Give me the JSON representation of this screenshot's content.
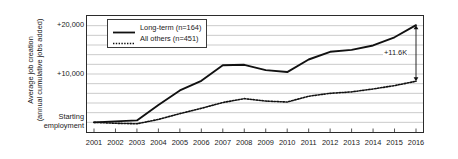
{
  "chart_data": {
    "type": "line",
    "title": "",
    "xlabel": "",
    "ylabel_line1": "Average job creation",
    "ylabel_line2": "(annual cumulative jobs added)",
    "x": [
      2001,
      2002,
      2003,
      2004,
      2005,
      2006,
      2007,
      2008,
      2009,
      2010,
      2011,
      2012,
      2013,
      2014,
      2015,
      2016
    ],
    "categories": [
      "2001",
      "2002",
      "2003",
      "2004",
      "2005",
      "2006",
      "2007",
      "2008",
      "2009",
      "2010",
      "2011",
      "2012",
      "2013",
      "2014",
      "2015",
      "2016"
    ],
    "series": [
      {
        "name": "Long-term (n=164)",
        "style": "solid",
        "color": "#111111",
        "values": [
          0,
          200,
          400,
          3600,
          6600,
          8600,
          11800,
          11900,
          10800,
          10400,
          13000,
          14600,
          15000,
          15900,
          17600,
          20100
        ]
      },
      {
        "name": "All others (n=451)",
        "style": "dotted",
        "color": "#111111",
        "values": [
          0,
          -200,
          -300,
          600,
          1800,
          2900,
          4100,
          4900,
          4400,
          4200,
          5400,
          6000,
          6300,
          6900,
          7600,
          8500
        ]
      }
    ],
    "ylim": [
      -2000,
      22000
    ],
    "yticks_major": [
      {
        "value": 20000,
        "label": "+20,000"
      },
      {
        "value": 10000,
        "label": "+10,000"
      },
      {
        "value": 0,
        "label": "Starting\nemployment"
      }
    ],
    "ytick_label_20000": "+20,000",
    "ytick_label_10000": "+10,000",
    "ytick_label_0_line1": "Starting",
    "ytick_label_0_line2": "employment",
    "gridline_step": 2000,
    "grid": true,
    "grid_color": "#b4b4b4",
    "legend_position": "top-left-inside",
    "annotations": [
      {
        "text": "+11.6K",
        "type": "double-arrow",
        "at_x": 2016,
        "from_value": 20100,
        "to_value": 8500
      }
    ],
    "annotation_label": "+11.6K",
    "axis_color": "#2b2b2b"
  },
  "legend": {
    "items": [
      {
        "label": "Long-term (n=164)",
        "style": "solid"
      },
      {
        "label": "All others (n=451)",
        "style": "dotted"
      }
    ],
    "item_0_label": "Long-term (n=164)",
    "item_1_label": "All others (n=451)"
  }
}
